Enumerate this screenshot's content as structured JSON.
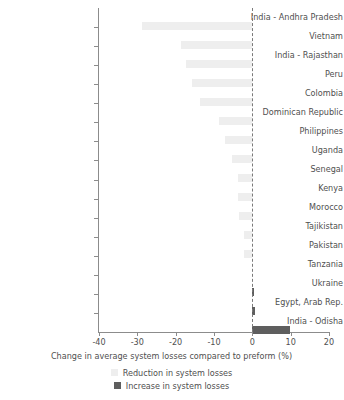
{
  "chart_data": {
    "type": "bar",
    "orientation": "horizontal",
    "title": "",
    "xlabel": "Change in average system losses compared to preform (%)",
    "ylabel": "",
    "xlim": [
      -40,
      20
    ],
    "xticks": [
      -40,
      -30,
      -20,
      -10,
      0,
      10,
      20
    ],
    "xticklabels": [
      "-40",
      "-30",
      "-20",
      "-10",
      "0",
      "10",
      "20"
    ],
    "grid": false,
    "zero_reference_line": true,
    "legend_position": "bottom",
    "categories": [
      "India - Andhra Pradesh",
      "Vietnam",
      "India - Rajasthan",
      "Peru",
      "Colombia",
      "Dominican Republic",
      "Philippines",
      "Uganda",
      "Senegal",
      "Kenya",
      "Morocco",
      "Tajikistan",
      "Pakistan",
      "Tanzania",
      "Ukraine",
      "Egypt, Arab Rep.",
      "India - Odisha"
    ],
    "values": [
      -28.9,
      -18.7,
      -17.3,
      -15.7,
      -13.6,
      -8.6,
      -7.1,
      -5.4,
      -3.8,
      -3.8,
      -3.5,
      -2.3,
      -2.3,
      0.0,
      0.3,
      0.6,
      9.9
    ],
    "series": [
      {
        "name": "Reduction in system losses",
        "color": "#eeeeee"
      },
      {
        "name": "Increase in system losses",
        "color": "#5e5e5e"
      }
    ],
    "legend": [
      {
        "label": "Reduction in system losses",
        "swatch": "reduction"
      },
      {
        "label": "Increase in system losses",
        "swatch": "increase"
      }
    ]
  },
  "colors": {
    "reduction": "#eeeeee",
    "increase": "#5e5e5e",
    "axis": "#8c8c8c",
    "text": "#4f4f4f",
    "background": "#ffffff"
  }
}
